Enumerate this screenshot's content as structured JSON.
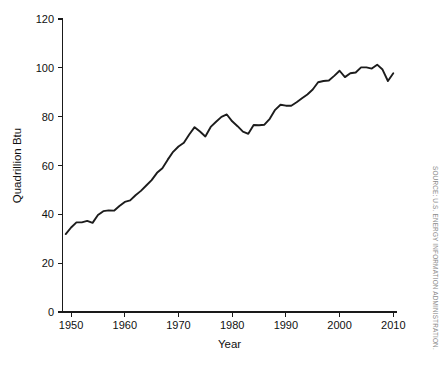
{
  "figure": {
    "background_color": "#ffffff",
    "line_color": "#1c1c1c",
    "axis_color": "#1a1a1a",
    "source_note": "SOURCE: U.S. ENERGY INFORMATION ADMINISTRATION."
  },
  "chart_data": {
    "type": "line",
    "title": "",
    "xlabel": "Year",
    "ylabel": "Quadrillion Btu",
    "xlim": [
      1948.4,
      2010.6
    ],
    "ylim": [
      0,
      120
    ],
    "xticks": [
      1950,
      1960,
      1970,
      1980,
      1990,
      2000,
      2010
    ],
    "xtick_labels": [
      "1950",
      "1960",
      "1970",
      "1980",
      "1990",
      "2000",
      "2010"
    ],
    "yticks": [
      0,
      20,
      40,
      60,
      80,
      100,
      120
    ],
    "ytick_labels": [
      "0",
      "20",
      "40",
      "60",
      "80",
      "100",
      "120"
    ],
    "grid": false,
    "legend": false,
    "series": [
      {
        "name": "Total primary energy consumption",
        "x": [
          1949,
          1950,
          1951,
          1952,
          1953,
          1954,
          1955,
          1956,
          1957,
          1958,
          1959,
          1960,
          1961,
          1962,
          1963,
          1964,
          1965,
          1966,
          1967,
          1968,
          1969,
          1970,
          1971,
          1972,
          1973,
          1974,
          1975,
          1976,
          1977,
          1978,
          1979,
          1980,
          1981,
          1982,
          1983,
          1984,
          1985,
          1986,
          1987,
          1988,
          1989,
          1990,
          1991,
          1992,
          1993,
          1994,
          1995,
          1996,
          1997,
          1998,
          1999,
          2000,
          2001,
          2002,
          2003,
          2004,
          2005,
          2006,
          2007,
          2008,
          2009,
          2010
        ],
        "y": [
          31.9,
          34.6,
          36.7,
          36.7,
          37.3,
          36.5,
          39.7,
          41.3,
          41.6,
          41.5,
          43.4,
          45.1,
          45.7,
          47.8,
          49.6,
          51.8,
          54.0,
          57.0,
          58.9,
          62.4,
          65.6,
          67.8,
          69.3,
          72.7,
          75.7,
          73.9,
          71.9,
          75.8,
          77.9,
          79.9,
          80.9,
          78.1,
          76.1,
          73.9,
          73.0,
          76.6,
          76.5,
          76.7,
          79.1,
          82.8,
          84.9,
          84.5,
          84.5,
          85.9,
          87.5,
          89.1,
          91.1,
          94.1,
          94.6,
          94.8,
          96.7,
          98.8,
          96.2,
          97.8,
          98.1,
          100.2,
          100.2,
          99.7,
          101.3,
          99.3,
          94.6,
          97.8
        ]
      }
    ]
  }
}
